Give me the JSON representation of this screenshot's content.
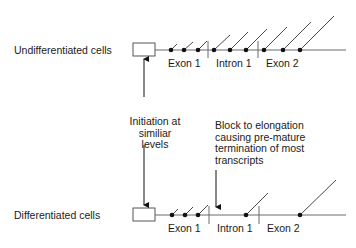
{
  "diagram": {
    "colors": {
      "line": "#6a6a6a",
      "ink": "#111111",
      "box": "#555555"
    },
    "rows": [
      {
        "name": "undifferentiated",
        "label": "Undifferentiated cells",
        "baseline_y": 50,
        "regions": [
          {
            "label": "Exon 1"
          },
          {
            "label": "Intron 1"
          },
          {
            "label": "Exon 2"
          }
        ]
      },
      {
        "name": "differentiated",
        "label": "Differentiated cells",
        "baseline_y": 215,
        "regions": [
          {
            "label": "Exon 1"
          },
          {
            "label": "Intron 1"
          },
          {
            "label": "Exon 2"
          }
        ]
      }
    ],
    "annotations": {
      "initiation": [
        "Initiation at",
        "similiar levels"
      ],
      "block": [
        "Block to elongation",
        "causing pre-mature",
        "termination of most",
        "transcripts"
      ]
    }
  }
}
